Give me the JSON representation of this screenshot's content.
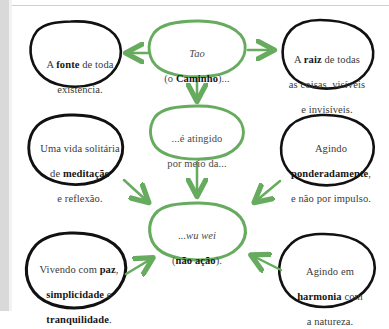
{
  "diagram": {
    "colors": {
      "accent_green": "#66ab5e",
      "outline_black": "#111111",
      "text_gray": "#3a3a3a",
      "page_edge_gray": "#d9d9d9",
      "background": "#ffffff"
    },
    "nodes": [
      {
        "id": "tao",
        "style": "green",
        "line1_italic": "Tao",
        "line2_prefix": "(o ",
        "line2_bold": "Caminho",
        "line2_suffix": ")..."
      },
      {
        "id": "fonte",
        "style": "black",
        "line1_prefix": "A ",
        "line1_bold": "fonte",
        "line1_suffix": " de toda",
        "line2": "existência."
      },
      {
        "id": "raiz",
        "style": "black",
        "line1_prefix": "A ",
        "line1_bold": "raiz",
        "line1_suffix": " de todas",
        "line2": "as coisas, visíveis",
        "line3": "e invisíveis."
      },
      {
        "id": "atingido",
        "style": "green",
        "line1": "...é atingido",
        "line2": "por meio da..."
      },
      {
        "id": "meditacao",
        "style": "black",
        "line1": "Uma vida solitária",
        "line2_prefix": "de ",
        "line2_bold": "meditação",
        "line3": "e reflexão."
      },
      {
        "id": "ponderadamente",
        "style": "black",
        "line1": "Agindo",
        "line2_bold": "ponderadamente",
        "line2_suffix": ",",
        "line3": "e não por impulso."
      },
      {
        "id": "wuwei",
        "style": "green",
        "line1_prefix": "...",
        "line1_italic": "wu wei",
        "line2_prefix": "(",
        "line2_bold": "não ação",
        "line2_suffix": ")."
      },
      {
        "id": "paz",
        "style": "black",
        "line1_prefix": "Vivendo com ",
        "line1_bold": "paz",
        "line1_suffix": ",",
        "line2_bold": "simplicidade",
        "line2_suffix": " e",
        "line3_bold": "tranquilidade",
        "line3_suffix": "."
      },
      {
        "id": "harmonia",
        "style": "black",
        "line1": "Agindo em",
        "line2_bold": "harmonia",
        "line2_suffix": " com",
        "line3": "a natureza."
      }
    ],
    "arrows": [
      {
        "id": "tao-to-fonte",
        "direction": "left"
      },
      {
        "id": "tao-to-raiz",
        "direction": "right"
      },
      {
        "id": "tao-to-atingido",
        "direction": "down"
      },
      {
        "id": "atingido-to-wuwei",
        "direction": "down"
      },
      {
        "id": "meditacao-to-wuwei",
        "direction": "down-right"
      },
      {
        "id": "ponderadamente-to-wuwei",
        "direction": "down-left"
      },
      {
        "id": "paz-to-wuwei",
        "direction": "up-right"
      },
      {
        "id": "harmonia-to-wuwei",
        "direction": "up-left"
      }
    ]
  }
}
